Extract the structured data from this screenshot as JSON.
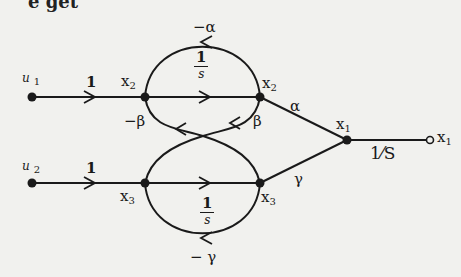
{
  "header_fragment": "e get",
  "diagram": {
    "type": "signal-flow-graph",
    "nodes": {
      "u1": {
        "label": "u",
        "sub": "1"
      },
      "u2": {
        "label": "u",
        "sub": "2"
      },
      "x2_left": {
        "label": "x",
        "sub": "2"
      },
      "x2_right": {
        "label": "x",
        "sub": "2"
      },
      "x3_left": {
        "label": "x",
        "sub": "3"
      },
      "x3_right": {
        "label": "x",
        "sub": "3"
      },
      "x1": {
        "label": "x",
        "sub": "1"
      },
      "x1_out": {
        "label": "x",
        "sub": "1"
      }
    },
    "branches": {
      "u1_to_x2": "1",
      "u2_to_x3": "1",
      "x2_integrator": {
        "num": "1",
        "den": "s"
      },
      "x3_integrator": {
        "num": "1",
        "den": "s"
      },
      "x2_self_loop": "−α",
      "x3_self_loop": "− γ",
      "x2_to_x3_cross": "−β",
      "x3_to_x2_cross": "β",
      "x2_to_x1": "α",
      "x3_to_x1": "γ",
      "x1_output": "1⁄S"
    }
  }
}
